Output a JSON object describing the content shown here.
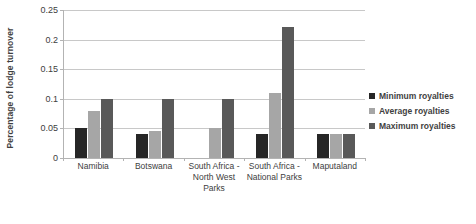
{
  "chart_data": {
    "type": "bar",
    "title": "",
    "xlabel": "",
    "ylabel": "Percentage of lodge turnover",
    "ylim": [
      0,
      0.25
    ],
    "ytick_labels": [
      "0.25",
      "0.2",
      "0.15",
      "0.1",
      "0.05",
      "0"
    ],
    "ytick_values": [
      0.25,
      0.2,
      0.15,
      0.1,
      0.05,
      0
    ],
    "grid": true,
    "legend_position": "right",
    "categories": [
      "Namibia",
      "Botswana",
      "South Africa - North West Parks",
      "South Africa - National Parks",
      "Maputaland"
    ],
    "category_lines": [
      [
        "Namibia"
      ],
      [
        "Botswana"
      ],
      [
        "South Africa -",
        "North West",
        "Parks"
      ],
      [
        "South Africa -",
        "National Parks"
      ],
      [
        "Maputaland"
      ]
    ],
    "series": [
      {
        "name": "Minimum royalties",
        "color": "#262626",
        "values": [
          0.05,
          0.04,
          0,
          0.04,
          0.04
        ]
      },
      {
        "name": "Average royalties",
        "color": "#a6a6a6",
        "values": [
          0.08,
          0.045,
          0.05,
          0.11,
          0.04
        ]
      },
      {
        "name": "Maximum royalties",
        "color": "#595959",
        "values": [
          0.1,
          0.1,
          0.1,
          0.222,
          0.04
        ]
      }
    ]
  },
  "legend": {
    "items": [
      {
        "label": "Minimum royalties",
        "color": "#262626"
      },
      {
        "label": "Average royalties",
        "color": "#a6a6a6"
      },
      {
        "label": "Maximum royalties",
        "color": "#595959"
      }
    ]
  },
  "colors": {
    "minimum": "#262626",
    "average": "#a6a6a6",
    "maximum": "#595959",
    "gridline": "#c8c8c8",
    "axis": "#b3b3b3",
    "text": "#404040",
    "background": "#ffffff"
  }
}
